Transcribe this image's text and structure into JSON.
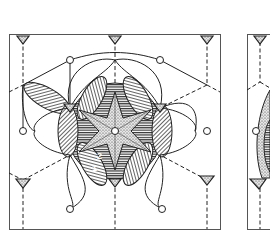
{
  "figure": {
    "panels": [
      {
        "id": "left-panel",
        "description": "hexagonal unit cell with six-fold petal pattern"
      },
      {
        "id": "right-panel",
        "description": "partially visible second unit cell"
      }
    ],
    "labels": [
      "2",
      "1"
    ],
    "colors": {
      "ink": "#222222",
      "paper": "#ffffff",
      "frame": "#555555"
    }
  }
}
